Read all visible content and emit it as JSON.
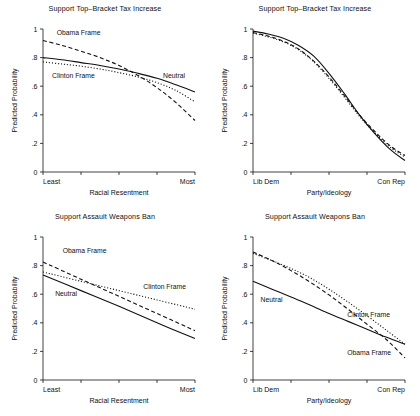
{
  "figure": {
    "ylabel": "Predicted Probability",
    "series_styles": {
      "Obama Frame": "dashed",
      "Clinton Frame": "dotted",
      "Neutral": "solid"
    },
    "line_color": "#111111",
    "background": "#ffffff"
  },
  "chart_data": [
    {
      "id": "top-left",
      "type": "line",
      "title": "Support Top–Bracket Tax Increase",
      "xlabel": "Racial Resentment",
      "ylabel": "Predicted Probability",
      "ylim": [
        0,
        1
      ],
      "yticks": [
        "0",
        ".2",
        ".4",
        ".6",
        ".8",
        "1"
      ],
      "ytick_values": [
        0,
        0.2,
        0.4,
        0.6,
        0.8,
        1
      ],
      "xlim": [
        0,
        1
      ],
      "xtick_labels": [
        "Least",
        "Most"
      ],
      "xtick_count": 5,
      "grid": false,
      "legend": "inline-annotations",
      "x": [
        0,
        0.125,
        0.25,
        0.375,
        0.5,
        0.625,
        0.75,
        0.875,
        1
      ],
      "series": [
        {
          "name": "Obama Frame",
          "style": "dashed",
          "label_x": 0.09,
          "label_y": 0.955,
          "values": [
            0.92,
            0.885,
            0.845,
            0.8,
            0.745,
            0.675,
            0.59,
            0.485,
            0.36
          ]
        },
        {
          "name": "Neutral",
          "style": "solid",
          "label_x": 0.79,
          "label_y": 0.655,
          "values": [
            0.8,
            0.785,
            0.765,
            0.745,
            0.72,
            0.69,
            0.655,
            0.61,
            0.56
          ]
        },
        {
          "name": "Clinton Frame",
          "style": "dotted",
          "label_x": 0.06,
          "label_y": 0.655,
          "values": [
            0.77,
            0.755,
            0.74,
            0.72,
            0.695,
            0.665,
            0.625,
            0.57,
            0.49
          ]
        }
      ]
    },
    {
      "id": "top-right",
      "type": "line",
      "title": "Support Top–Bracket Tax Increase",
      "xlabel": "Party/Ideology",
      "ylabel": "Predicted Probability",
      "ylim": [
        0,
        1
      ],
      "yticks": [
        "0",
        ".2",
        ".4",
        ".6",
        ".8",
        "1"
      ],
      "ytick_values": [
        0,
        0.2,
        0.4,
        0.6,
        0.8,
        1
      ],
      "xlim": [
        0,
        1
      ],
      "xtick_labels": [
        "Lib Dem",
        "Con Rep"
      ],
      "xtick_count": 5,
      "grid": false,
      "legend": "none",
      "x": [
        0,
        0.1,
        0.2,
        0.3,
        0.4,
        0.5,
        0.6,
        0.7,
        0.8,
        0.9,
        1
      ],
      "series": [
        {
          "name": "Neutral",
          "style": "solid",
          "values": [
            0.985,
            0.965,
            0.935,
            0.885,
            0.81,
            0.69,
            0.55,
            0.4,
            0.27,
            0.16,
            0.08
          ]
        },
        {
          "name": "Obama Frame",
          "style": "dashed",
          "values": [
            0.975,
            0.95,
            0.915,
            0.86,
            0.775,
            0.665,
            0.535,
            0.4,
            0.285,
            0.185,
            0.115
          ]
        },
        {
          "name": "Clinton Frame",
          "style": "dotted",
          "values": [
            0.97,
            0.945,
            0.91,
            0.855,
            0.77,
            0.655,
            0.525,
            0.39,
            0.275,
            0.175,
            0.105
          ]
        }
      ]
    },
    {
      "id": "bottom-left",
      "type": "line",
      "title": "Support Assault Weapons Ban",
      "xlabel": "Racial Resentment",
      "ylabel": "Predicted Probability",
      "ylim": [
        0,
        1
      ],
      "yticks": [
        "0",
        ".2",
        ".4",
        ".6",
        ".8",
        "1"
      ],
      "ytick_values": [
        0,
        0.2,
        0.4,
        0.6,
        0.8,
        1
      ],
      "xlim": [
        0,
        1
      ],
      "xtick_labels": [
        "Least",
        "Most"
      ],
      "xtick_count": 5,
      "grid": false,
      "legend": "inline-annotations",
      "x": [
        0,
        0.25,
        0.5,
        0.75,
        1
      ],
      "series": [
        {
          "name": "Obama Frame",
          "style": "dashed",
          "label_x": 0.13,
          "label_y": 0.885,
          "values": [
            0.825,
            0.705,
            0.585,
            0.465,
            0.345
          ]
        },
        {
          "name": "Clinton Frame",
          "style": "dotted",
          "label_x": 0.66,
          "label_y": 0.635,
          "values": [
            0.755,
            0.69,
            0.625,
            0.56,
            0.495
          ]
        },
        {
          "name": "Neutral",
          "style": "solid",
          "label_x": 0.08,
          "label_y": 0.59,
          "values": [
            0.735,
            0.625,
            0.515,
            0.4,
            0.29
          ]
        }
      ]
    },
    {
      "id": "bottom-right",
      "type": "line",
      "title": "Support Assault Weapons Ban",
      "xlabel": "Party/Ideology",
      "ylabel": "Predicted Probability",
      "ylim": [
        0,
        1
      ],
      "yticks": [
        "0",
        ".2",
        ".4",
        ".6",
        ".8",
        "1"
      ],
      "ytick_values": [
        0,
        0.2,
        0.4,
        0.6,
        0.8,
        1
      ],
      "xlim": [
        0,
        1
      ],
      "xtick_labels": [
        "Lib Dem",
        "Con Rep"
      ],
      "xtick_count": 5,
      "grid": false,
      "legend": "inline-annotations",
      "x": [
        0,
        0.125,
        0.25,
        0.375,
        0.5,
        0.625,
        0.75,
        0.875,
        1
      ],
      "series": [
        {
          "name": "Obama Frame",
          "style": "dashed",
          "label_x": 0.62,
          "label_y": 0.175,
          "values": [
            0.895,
            0.835,
            0.765,
            0.685,
            0.595,
            0.495,
            0.39,
            0.285,
            0.155
          ]
        },
        {
          "name": "Clinton Frame",
          "style": "dotted",
          "label_x": 0.62,
          "label_y": 0.44,
          "values": [
            0.885,
            0.835,
            0.78,
            0.715,
            0.635,
            0.545,
            0.45,
            0.35,
            0.25
          ]
        },
        {
          "name": "Neutral",
          "style": "solid",
          "label_x": 0.05,
          "label_y": 0.545,
          "values": [
            0.69,
            0.635,
            0.58,
            0.525,
            0.465,
            0.41,
            0.355,
            0.3,
            0.25
          ]
        }
      ]
    }
  ]
}
